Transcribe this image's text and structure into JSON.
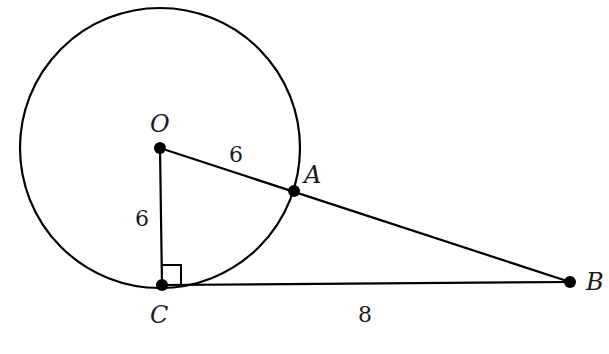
{
  "diagram": {
    "type": "geometry",
    "circle": {
      "center": "O",
      "radius": 6
    },
    "points": [
      {
        "name": "O",
        "label": "O"
      },
      {
        "name": "A",
        "label": "A"
      },
      {
        "name": "B",
        "label": "B"
      },
      {
        "name": "C",
        "label": "C"
      }
    ],
    "segments": [
      {
        "from": "O",
        "to": "A",
        "length_label": "6"
      },
      {
        "from": "O",
        "to": "C",
        "length_label": "6"
      },
      {
        "from": "C",
        "to": "B",
        "length_label": "8"
      },
      {
        "from": "A",
        "to": "B",
        "length_label": ""
      }
    ],
    "right_angle_at": "C",
    "colors": {
      "stroke": "#000000",
      "background": "#ffffff"
    }
  },
  "labels": {
    "O": "O",
    "A": "A",
    "B": "B",
    "C": "C",
    "OA": "6",
    "OC": "6",
    "CB": "8"
  }
}
